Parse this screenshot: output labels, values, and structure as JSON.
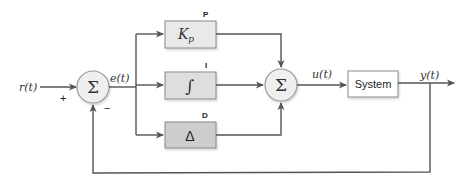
{
  "diagram": {
    "type": "PID controller block diagram",
    "signals": {
      "reference": "r(t)",
      "error": "e(t)",
      "control": "u(t)",
      "output": "y(t)"
    },
    "summing_junctions": {
      "input": {
        "symbol": "Σ",
        "plus_sign": "+",
        "minus_sign": "−"
      },
      "controller": {
        "symbol": "Σ"
      }
    },
    "blocks": {
      "p": {
        "tag": "P",
        "label_main": "K",
        "label_sub": "p",
        "fill": "#e9e9e9"
      },
      "i": {
        "tag": "I",
        "label": "∫",
        "fill": "#dedede"
      },
      "d": {
        "tag": "D",
        "label": "Δ",
        "fill": "#cdcdcd"
      },
      "plant": {
        "label": "System",
        "fill": "#ffffff"
      }
    },
    "colors": {
      "wire": "#555555",
      "sum_fill": "#efefef",
      "box_border": "#8a8a8a"
    }
  }
}
